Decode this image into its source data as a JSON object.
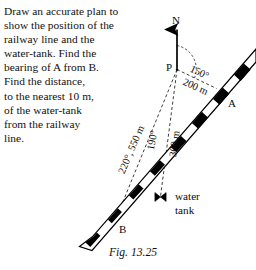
{
  "question": {
    "lines": [
      "Draw an accurate plan to",
      "show the position of the",
      "railway line and the",
      "water-tank. Find the",
      "bearing of A from B.",
      "Find the distance,",
      "to the nearest 10 m,",
      "of the water-tank",
      "from the railway",
      "line."
    ]
  },
  "figure": {
    "north_label": "N",
    "point_p": "P",
    "point_a": "A",
    "point_b": "B",
    "bearing_pa": "150°",
    "distance_pa": "200 m",
    "bearing_pb": "220°",
    "distance_pb": "550 m",
    "bearing_pt": "190°",
    "distance_pt": "300 m",
    "water_tank_line1": "water",
    "water_tank_line2": "tank",
    "ink_color": "#000000",
    "paper_color": "#ffffff"
  },
  "caption": {
    "text": "Fig. 13.25"
  }
}
